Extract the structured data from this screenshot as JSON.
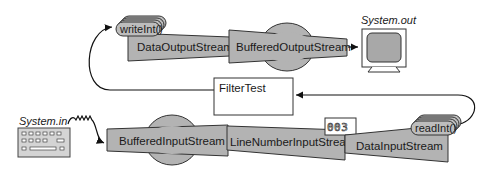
{
  "diagram": {
    "program": {
      "label": "FilterTest"
    },
    "output_chain": {
      "method": "writeInt()",
      "streams": [
        {
          "label": "DataOutputStream"
        },
        {
          "label": "BufferedOutputStream"
        }
      ],
      "sink": {
        "label": "System.out",
        "icon": "monitor-icon"
      }
    },
    "input_chain": {
      "source": {
        "label": "System.in",
        "icon": "keyboard-icon"
      },
      "streams": [
        {
          "label": "BufferedInputStream"
        },
        {
          "label": "LineNumberInputStream",
          "counter": "003"
        },
        {
          "label": "DataInputStream"
        }
      ],
      "method": "readInt()"
    },
    "colors": {
      "stream_fill": "#b3b3b3",
      "stroke": "#333333",
      "background": "#ffffff"
    }
  }
}
